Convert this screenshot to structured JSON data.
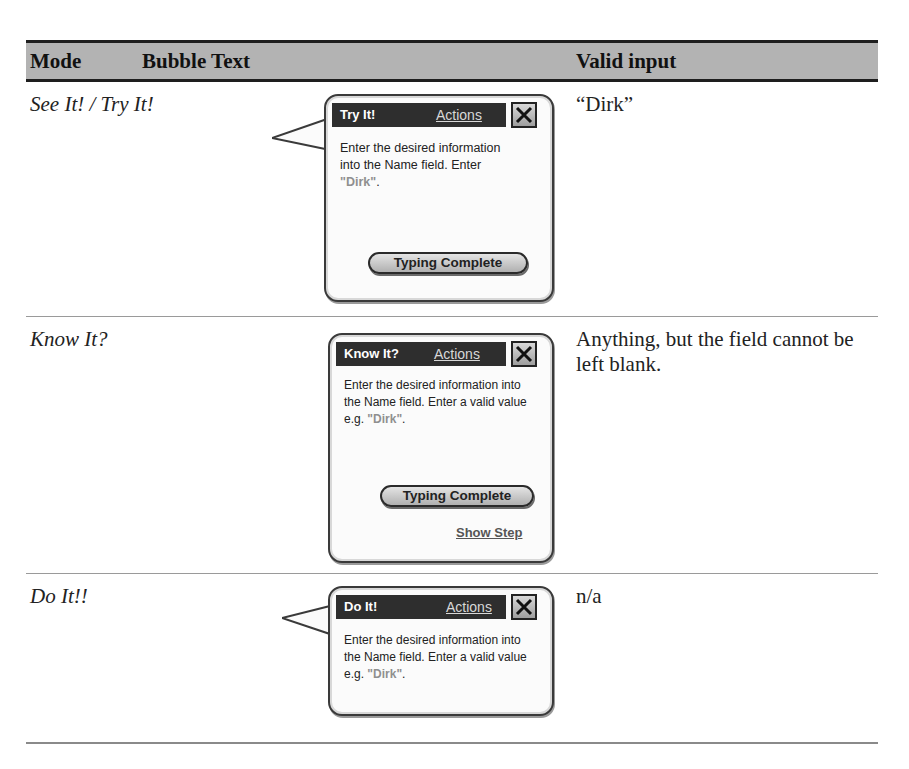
{
  "table": {
    "headers": {
      "mode": "Mode",
      "bubble_text": "Bubble Text",
      "valid_input": "Valid input"
    },
    "rows": [
      {
        "mode": "See It! / Try It!",
        "bubble": {
          "title": "Try It!",
          "actions_label": "Actions",
          "close_icon": "close-x-icon",
          "body_prefix": "Enter the desired information into the Name field. Enter ",
          "body_value": "\"Dirk\"",
          "body_suffix": ".",
          "button_label": "Typing Complete"
        },
        "valid_input": "“Dirk”"
      },
      {
        "mode": "Know It?",
        "bubble": {
          "title": "Know It?",
          "actions_label": "Actions",
          "close_icon": "close-x-icon",
          "body_prefix": "Enter the desired information into the Name field. Enter a valid value e.g. ",
          "body_value": "\"Dirk\"",
          "body_suffix": ".",
          "button_label": "Typing Complete",
          "link_label": "Show Step"
        },
        "valid_input": "Anything, but the field cannot be left blank."
      },
      {
        "mode": "Do It!!",
        "bubble": {
          "title": "Do It!",
          "actions_label": "Actions",
          "close_icon": "close-x-icon",
          "body_prefix": "Enter the desired information into the Name field. Enter a valid value e.g. ",
          "body_value": "\"Dirk\"",
          "body_suffix": "."
        },
        "valid_input": "n/a"
      }
    ]
  },
  "colors": {
    "header_bg": "#b3b3b3",
    "bubble_title_bg": "#2e2e2e",
    "dirk_value": "#8f8f8f"
  }
}
